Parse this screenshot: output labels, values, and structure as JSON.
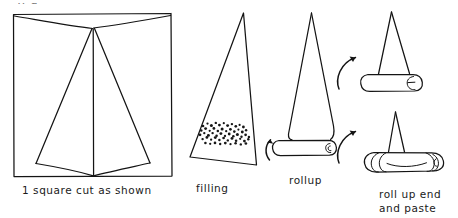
{
  "figure": {
    "kind": "hand-drawn-instructional-diagram",
    "step_count": 4,
    "ink_color": "#141414",
    "background_color": "#ffffff",
    "cut_off_text_top": "y  g"
  },
  "steps": [
    {
      "id": "step-1",
      "caption": "1 square cut as shown",
      "shape": "square",
      "description": "Square outlined with diagonal cut lines meeting at top-centre apex and bottom-centre point"
    },
    {
      "id": "step-2",
      "caption": "filling",
      "shape": "tall-triangle",
      "description": "Tall narrow triangle with a speckled band of filling near the wide base"
    },
    {
      "id": "step-3",
      "caption": "rollup",
      "shape": "triangle-with-rolled-base",
      "description": "Triangle whose base has been rolled into a cylinder; curved arrows indicate rolling direction"
    },
    {
      "id": "step-4",
      "caption": "roll up end and paste",
      "shape": "rolled-cylinder-ends-tucked",
      "description": "Two sub-figures: cylinder with one end spiral, then cylinder with both ends rolled inward and pasted"
    }
  ],
  "arrows": [
    {
      "id": "arrow-rollup-left",
      "direction": "counter-clockwise-up",
      "meaning": "roll the base upward"
    },
    {
      "id": "arrow-rollup-right",
      "direction": "clockwise-up",
      "meaning": "continue rolling"
    },
    {
      "id": "arrow-to-step4-top",
      "direction": "up-right",
      "meaning": "proceed to tucking ends"
    },
    {
      "id": "arrow-to-step4-bottom",
      "direction": "up-right",
      "meaning": "proceed to pasting"
    }
  ]
}
